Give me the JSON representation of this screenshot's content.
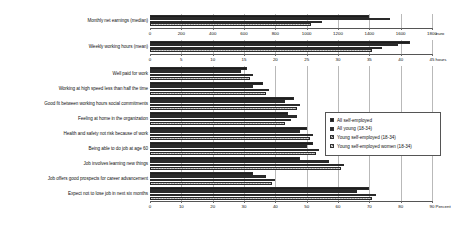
{
  "chart_data": {
    "type": "bar",
    "orientation": "horizontal",
    "title": "",
    "legend_position": "right",
    "grid": true,
    "series_names": [
      "All self-employed",
      "All young (18-34)",
      "Young self-employed (18-34)",
      "Young self-employed women (18-34)"
    ],
    "panels": [
      {
        "name": "earnings",
        "categories": [
          "Monthly net earnings (median)"
        ],
        "xlabel": "euro",
        "xlim": [
          0,
          1800
        ],
        "xticks": [
          0,
          200,
          400,
          600,
          800,
          1000,
          1200,
          1400,
          1600,
          1800
        ],
        "series": [
          {
            "name": "All self-employed",
            "values": [
              1400
            ]
          },
          {
            "name": "All young (18-34)",
            "values": [
              1530
            ]
          },
          {
            "name": "Young self-employed (18-34)",
            "values": [
              1100
            ]
          },
          {
            "name": "Young self-employed women (18-34)",
            "values": [
              1030
            ]
          }
        ]
      },
      {
        "name": "hours",
        "categories": [
          "Weekly working hours (mean)"
        ],
        "xlabel": "hours",
        "xlim": [
          0,
          45
        ],
        "xticks": [
          0,
          5,
          10,
          15,
          20,
          25,
          30,
          35,
          40,
          45
        ],
        "series": [
          {
            "name": "All self-employed",
            "values": [
              41.5
            ]
          },
          {
            "name": "All young (18-34)",
            "values": [
              39.5
            ]
          },
          {
            "name": "Young self-employed (18-34)",
            "values": [
              37.0
            ]
          },
          {
            "name": "Young self-employed women (18-34)",
            "values": [
              35.5
            ]
          }
        ]
      },
      {
        "name": "percent",
        "categories": [
          "Well paid for work",
          "Working at high speed less than half the time",
          "Good fit between working hours social commitments",
          "Feeling at home in the organization",
          "Health and safety not risk because of work",
          "Being able to do job at age 60",
          "Job involves learning new things",
          "Job offers good prospects for career advancement",
          "Expect not to lose job in next six months"
        ],
        "xlabel": "Percent",
        "xlim": [
          0,
          90
        ],
        "xticks": [
          0,
          10,
          20,
          30,
          40,
          50,
          60,
          70,
          80,
          90
        ],
        "series": [
          {
            "name": "All self-employed",
            "values": [
              31,
              36,
              46,
              44,
              50,
              52,
              48,
              33,
              70
            ]
          },
          {
            "name": "All young (18-34)",
            "values": [
              29,
              33,
              43,
              47,
              48,
              50,
              57,
              37,
              66
            ]
          },
          {
            "name": "Young self-employed (18-34)",
            "values": [
              33,
              38,
              48,
              45,
              52,
              54,
              62,
              40,
              72
            ]
          },
          {
            "name": "Young self-employed women (18-34)",
            "values": [
              32,
              37,
              47,
              43,
              51,
              53,
              61,
              39,
              71
            ]
          }
        ]
      }
    ]
  },
  "legend": {
    "items": [
      "All self-employed",
      "All young (18-34)",
      "Young self-employed (18-34)",
      "Young self-employed women (18-34)"
    ]
  }
}
